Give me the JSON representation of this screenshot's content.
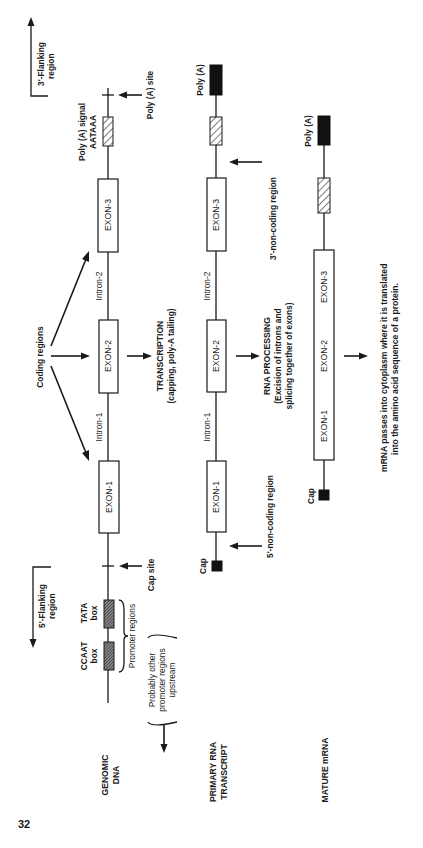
{
  "page_number": "32",
  "flanking": {
    "three_prime": [
      "3'-Flanking",
      "region"
    ],
    "five_prime": [
      "5'-Flanking",
      "region"
    ]
  },
  "stages": {
    "genomic": [
      "GENOMIC",
      "DNA"
    ],
    "primary": [
      "PRIMARY RNA",
      "TRANSCRIPT"
    ],
    "mature": [
      "MATURE mRNA"
    ]
  },
  "genomic": {
    "exons": [
      "EXON-1",
      "EXON-2",
      "EXON-3"
    ],
    "introns": [
      "Intron-1",
      "Intron-2"
    ],
    "polya_signal": [
      "Poly (A) signal",
      "AATAAA"
    ],
    "polya_site": "Poly (A) site",
    "cap_site": "Cap site",
    "tata_box": [
      "TATA",
      "box"
    ],
    "ccaat_box": [
      "CCAAT",
      "box"
    ],
    "promoter_regions": "Promoter regions",
    "other_promoters": [
      "Probably other",
      "promoter regions",
      "upstream"
    ],
    "coding_regions": "Coding regions"
  },
  "primary": {
    "exons": [
      "EXON-1",
      "EXON-2",
      "EXON-3"
    ],
    "introns": [
      "Intron-1",
      "Intron-2"
    ],
    "polya": "Poly (A)",
    "cap": "Cap",
    "three_noncoding": "3'-non-coding region",
    "five_noncoding": "5'-non-coding region"
  },
  "mature": {
    "exons": [
      "EXON-1",
      "EXON-2",
      "EXON-3"
    ],
    "polya": "Poly (A)",
    "cap": "Cap"
  },
  "steps": {
    "transcription": [
      "TRANSCRIPTION",
      "(capping, poly-A tailing)"
    ],
    "processing": [
      "RNA PROCESSING",
      "(Excision of introns and",
      "splicing together of exons)"
    ],
    "translation": [
      "mRNA passes into cytoplasm where it is translated",
      "into the amino acid sequence of a protein."
    ]
  }
}
